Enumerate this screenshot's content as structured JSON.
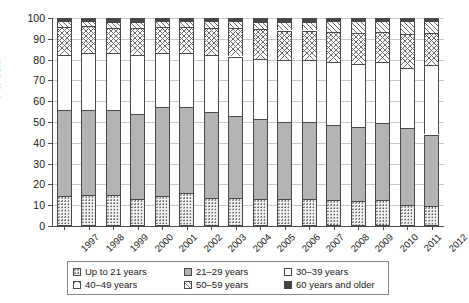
{
  "chart_data": {
    "type": "bar",
    "subtype": "stacked-bar-100-percent",
    "title": "",
    "subtitle": "",
    "xlabel": "",
    "ylabel": "Per cent",
    "ylim": [
      0,
      100
    ],
    "ytick_step": 10,
    "yticks": [
      0,
      10,
      20,
      30,
      40,
      50,
      60,
      70,
      80,
      90,
      100
    ],
    "grid": true,
    "grid_axis": "y",
    "legend_position": "bottom",
    "categories": [
      "1997",
      "1998",
      "1999",
      "2000",
      "2001",
      "2002",
      "2003",
      "2004",
      "2005",
      "2006",
      "2007",
      "2008",
      "2009",
      "2010",
      "2011",
      "2012"
    ],
    "series": [
      {
        "name": "Up to 21 years",
        "pattern": "dots",
        "color": "#f2f2f2",
        "values": [
          14.5,
          15.0,
          15.0,
          13.0,
          14.5,
          16.0,
          13.5,
          13.5,
          13.0,
          13.0,
          13.0,
          12.5,
          12.0,
          12.5,
          10.0,
          9.5
        ]
      },
      {
        "name": "21–29 years",
        "pattern": "solid-gray",
        "color": "#b3b3b3",
        "values": [
          41.5,
          41.0,
          41.0,
          41.0,
          42.5,
          41.0,
          41.5,
          39.5,
          38.5,
          37.0,
          37.0,
          36.0,
          35.5,
          37.0,
          37.0,
          34.5
        ]
      },
      {
        "name": "30–39 years",
        "pattern": "white",
        "color": "#ffffff",
        "values": [
          26.0,
          27.0,
          27.0,
          28.0,
          26.0,
          26.0,
          27.0,
          28.5,
          29.0,
          30.0,
          30.0,
          30.5,
          30.5,
          29.5,
          29.0,
          33.5
        ]
      },
      {
        "name": "40–49 years",
        "pattern": "crosshatch",
        "color": "#ffffff",
        "values": [
          13.5,
          13.0,
          12.0,
          13.0,
          12.5,
          12.5,
          13.0,
          13.5,
          14.0,
          14.0,
          14.0,
          14.5,
          15.0,
          14.5,
          16.5,
          15.5
        ]
      },
      {
        "name": "50–59 years",
        "pattern": "diagonal-hatch",
        "color": "#ffffff",
        "values": [
          3.0,
          2.5,
          3.0,
          3.0,
          3.0,
          3.0,
          3.5,
          3.5,
          3.5,
          4.0,
          4.0,
          5.0,
          5.5,
          5.0,
          6.0,
          5.5
        ]
      },
      {
        "name": "60 years and older",
        "pattern": "dark",
        "color": "#474747",
        "values": [
          1.5,
          1.5,
          2.0,
          2.0,
          1.5,
          1.5,
          1.5,
          1.5,
          2.0,
          2.0,
          2.0,
          1.5,
          1.5,
          1.5,
          1.5,
          1.5
        ]
      }
    ]
  },
  "axis": {
    "ylabel": "Per cent"
  },
  "legend": {
    "items": [
      {
        "label": "Up to 21 years",
        "pattern": "dots"
      },
      {
        "label": "21–29 years",
        "pattern": "solid-gray"
      },
      {
        "label": "30–39 years",
        "pattern": "white"
      },
      {
        "label": "40–49 years",
        "pattern": "crosshatch"
      },
      {
        "label": "50–59 years",
        "pattern": "diagonal-hatch"
      },
      {
        "label": "60 years and older",
        "pattern": "dark"
      }
    ]
  }
}
